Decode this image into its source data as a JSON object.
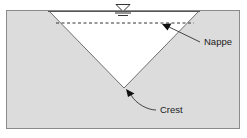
{
  "figure": {
    "background_color": "#ffffff",
    "frame": {
      "border_color": "#8a8a8a",
      "x": 6,
      "y": 10,
      "width": 234,
      "height": 119
    },
    "weir_body": {
      "name": "dam-body",
      "fill_color": "#dcdcdc",
      "outline_color": "#8a8a8a",
      "description": "Shaded embankment / weir plate surrounding the notch"
    },
    "notch": {
      "name": "v-notch-opening",
      "fill_color": "#ffffff",
      "outline_color": "#6e6e6e",
      "left_top": {
        "x": 48,
        "y": 10
      },
      "right_top": {
        "x": 200,
        "y": 10
      },
      "crest_vertex": {
        "x": 124,
        "y": 88
      }
    },
    "water_surface_line": {
      "name": "water-surface-line",
      "color": "#404040",
      "y": 12,
      "x_start": 48,
      "x_end": 200
    },
    "nappe_dashed_line": {
      "name": "nappe-dashed-line",
      "color": "#333333",
      "style": "dashed",
      "y": 23,
      "x_start": 56,
      "x_end": 194
    }
  },
  "symbols": {
    "water_level": {
      "name": "water-level-symbol",
      "description": "Inverted triangle with two horizontal bars marking free water surface",
      "x": 116,
      "y": 4,
      "color": "#333333"
    }
  },
  "annotations": [
    {
      "id": "nappe",
      "label": "Nappe",
      "name": "nappe-label",
      "text_x": 204,
      "text_y": 45,
      "arrow_tip": {
        "x": 162,
        "y": 24
      },
      "leader_from": {
        "x": 200,
        "y": 42
      },
      "arrow_color": "#111111",
      "leader_color": "#333333"
    },
    {
      "id": "crest",
      "label": "Crest",
      "name": "crest-label",
      "text_x": 160,
      "text_y": 113,
      "arrow_tip": {
        "x": 126,
        "y": 89
      },
      "leader_from": {
        "x": 156,
        "y": 110
      },
      "arrow_color": "#111111",
      "leader_color": "#333333"
    }
  ],
  "colors": {
    "body_fill": "#dcdcdc",
    "notch_fill": "#ffffff",
    "frame_border": "#8a8a8a",
    "line_dark": "#333333",
    "text": "#1b1b1b"
  }
}
